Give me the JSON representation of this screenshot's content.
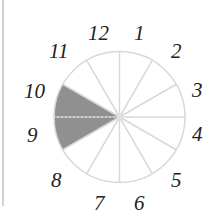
{
  "diagram": {
    "type": "clock-fraction-circle",
    "sectors_total": 12,
    "shaded_sectors": [
      9,
      10
    ],
    "labels": [
      "12",
      "1",
      "2",
      "3",
      "4",
      "5",
      "6",
      "7",
      "8",
      "9",
      "10",
      "11"
    ],
    "colors": {
      "shade": "#909090",
      "lines": "#d8d8d8",
      "text": "#222222"
    }
  }
}
